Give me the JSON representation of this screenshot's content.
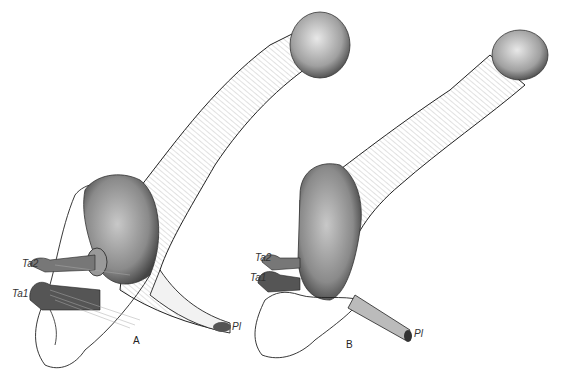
{
  "figure": {
    "panels": [
      {
        "id": "A",
        "label": "A"
      },
      {
        "id": "B",
        "label": "B"
      }
    ],
    "labels": {
      "A": {
        "ta2": "Ta2",
        "ta1": "Ta1",
        "pl": "Pl"
      },
      "B": {
        "ta2": "Ta2",
        "ta1": "Ta1",
        "pl": "Pl"
      }
    },
    "colors": {
      "ink": "#1a1a1a",
      "stipple": "#555555",
      "paper": "#ffffff"
    }
  }
}
